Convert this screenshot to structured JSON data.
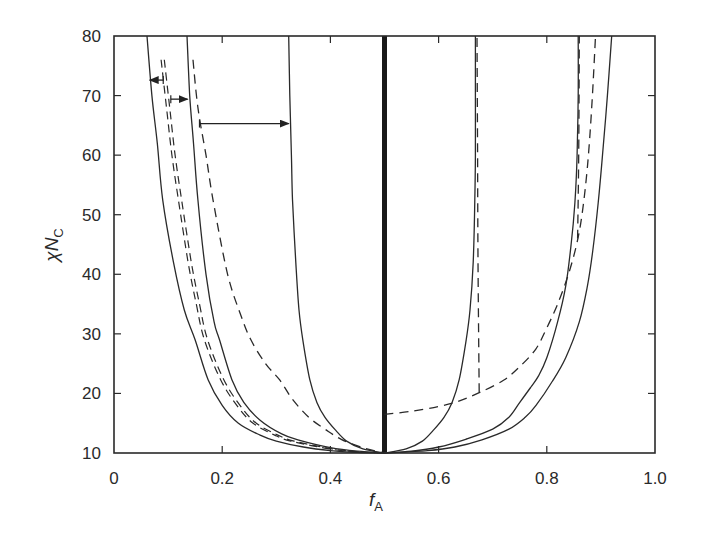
{
  "chart_data": {
    "type": "line",
    "title": "",
    "xlabel": "f",
    "xlabel_subscript": "A",
    "ylabel": "χN",
    "ylabel_subscript": "C",
    "xlim": [
      0,
      1.0
    ],
    "ylim": [
      10,
      80
    ],
    "grid": false,
    "legend": "none",
    "xticks": [
      0,
      0.2,
      0.4,
      0.6,
      0.8,
      1.0
    ],
    "xtick_labels": [
      "0",
      "0.2",
      "0.4",
      "0.6",
      "0.8",
      "1.0"
    ],
    "yticks": [
      10,
      20,
      30,
      40,
      50,
      60,
      70,
      80
    ],
    "ytick_labels": [
      "10",
      "20",
      "30",
      "40",
      "50",
      "60",
      "70",
      "80"
    ],
    "series": [
      {
        "name": "left-outer-solid",
        "style": "solid",
        "points": [
          [
            0.061,
            80
          ],
          [
            0.07,
            70
          ],
          [
            0.08,
            62
          ],
          [
            0.09,
            52.5
          ],
          [
            0.11,
            42
          ],
          [
            0.13,
            34
          ],
          [
            0.15,
            29
          ],
          [
            0.174,
            22.3
          ],
          [
            0.2,
            18
          ],
          [
            0.23,
            15
          ],
          [
            0.27,
            13
          ],
          [
            0.3,
            12
          ],
          [
            0.35,
            11
          ],
          [
            0.4,
            10.4
          ],
          [
            0.45,
            10.1
          ],
          [
            0.5,
            10
          ]
        ]
      },
      {
        "name": "left-double-dashed",
        "style": "double-dashed",
        "points": [
          [
            0.09,
            76
          ],
          [
            0.1,
            68
          ],
          [
            0.11,
            60
          ],
          [
            0.122,
            52.5
          ],
          [
            0.14,
            42
          ],
          [
            0.155,
            35
          ],
          [
            0.17,
            29
          ],
          [
            0.2,
            22.3
          ],
          [
            0.23,
            18
          ],
          [
            0.26,
            15
          ],
          [
            0.3,
            13
          ],
          [
            0.33,
            12
          ],
          [
            0.4,
            10.7
          ],
          [
            0.45,
            10.2
          ],
          [
            0.5,
            10
          ]
        ]
      },
      {
        "name": "left-second-solid",
        "style": "solid",
        "points": [
          [
            0.135,
            80
          ],
          [
            0.14,
            70
          ],
          [
            0.147,
            62
          ],
          [
            0.155,
            52.5
          ],
          [
            0.17,
            40
          ],
          [
            0.185,
            32
          ],
          [
            0.195,
            29
          ],
          [
            0.218,
            22.3
          ],
          [
            0.24,
            18.5
          ],
          [
            0.27,
            15.5
          ],
          [
            0.31,
            13.2
          ],
          [
            0.34,
            12.2
          ],
          [
            0.4,
            10.9
          ],
          [
            0.45,
            10.3
          ],
          [
            0.5,
            10
          ]
        ]
      },
      {
        "name": "left-dashed",
        "style": "dashed",
        "points": [
          [
            0.146,
            76
          ],
          [
            0.155,
            68
          ],
          [
            0.17,
            60
          ],
          [
            0.183,
            52.5
          ],
          [
            0.21,
            40
          ],
          [
            0.235,
            33
          ],
          [
            0.253,
            29
          ],
          [
            0.28,
            25
          ],
          [
            0.306,
            22.3
          ],
          [
            0.33,
            19
          ],
          [
            0.36,
            16
          ],
          [
            0.39,
            14
          ],
          [
            0.42,
            12.3
          ],
          [
            0.46,
            10.9
          ],
          [
            0.5,
            10
          ]
        ]
      },
      {
        "name": "left-inner-solid",
        "style": "solid",
        "points": [
          [
            0.323,
            80
          ],
          [
            0.325,
            70
          ],
          [
            0.328,
            60
          ],
          [
            0.33,
            52.5
          ],
          [
            0.336,
            42
          ],
          [
            0.342,
            34
          ],
          [
            0.349,
            29
          ],
          [
            0.362,
            22.3
          ],
          [
            0.375,
            18.5
          ],
          [
            0.39,
            16
          ],
          [
            0.41,
            13.8
          ],
          [
            0.43,
            12
          ],
          [
            0.46,
            10.7
          ],
          [
            0.5,
            10
          ]
        ]
      },
      {
        "name": "center-thick",
        "style": "thick",
        "points": [
          [
            0.5,
            10
          ],
          [
            0.5,
            80
          ]
        ]
      },
      {
        "name": "right-inner-solid",
        "style": "solid",
        "points": [
          [
            0.5,
            10
          ],
          [
            0.54,
            10.7
          ],
          [
            0.57,
            12
          ],
          [
            0.59,
            13.8
          ],
          [
            0.61,
            16
          ],
          [
            0.625,
            18.5
          ],
          [
            0.638,
            22.3
          ],
          [
            0.651,
            29
          ],
          [
            0.658,
            34
          ],
          [
            0.664,
            42
          ],
          [
            0.667,
            52.5
          ],
          [
            0.668,
            60
          ],
          [
            0.668,
            70
          ],
          [
            0.668,
            80
          ]
        ]
      },
      {
        "name": "right-middle-solid",
        "style": "solid",
        "points": [
          [
            0.5,
            10
          ],
          [
            0.55,
            10.3
          ],
          [
            0.6,
            11
          ],
          [
            0.65,
            12.3
          ],
          [
            0.7,
            14
          ],
          [
            0.73,
            16
          ],
          [
            0.75,
            18.5
          ],
          [
            0.77,
            21
          ],
          [
            0.785,
            23
          ],
          [
            0.8,
            26
          ],
          [
            0.82,
            32
          ],
          [
            0.835,
            38
          ],
          [
            0.845,
            45
          ],
          [
            0.852,
            52
          ],
          [
            0.856,
            60
          ],
          [
            0.858,
            70
          ],
          [
            0.858,
            80
          ]
        ]
      },
      {
        "name": "right-outer-solid",
        "style": "solid",
        "points": [
          [
            0.5,
            10
          ],
          [
            0.58,
            10.4
          ],
          [
            0.63,
            11
          ],
          [
            0.68,
            12.2
          ],
          [
            0.73,
            14
          ],
          [
            0.76,
            16
          ],
          [
            0.78,
            18
          ],
          [
            0.81,
            22
          ],
          [
            0.835,
            26
          ],
          [
            0.86,
            32
          ],
          [
            0.875,
            38
          ],
          [
            0.885,
            44
          ],
          [
            0.895,
            52
          ],
          [
            0.903,
            60
          ],
          [
            0.912,
            70
          ],
          [
            0.92,
            80
          ]
        ]
      },
      {
        "name": "right-dashed-curve",
        "style": "dashed",
        "points": [
          [
            0.5,
            16.5
          ],
          [
            0.55,
            17
          ],
          [
            0.6,
            17.8
          ],
          [
            0.64,
            18.8
          ],
          [
            0.677,
            20.2
          ],
          [
            0.72,
            22.2
          ],
          [
            0.75,
            24.5
          ],
          [
            0.78,
            27.5
          ],
          [
            0.8,
            31
          ],
          [
            0.82,
            35
          ],
          [
            0.84,
            40
          ],
          [
            0.855,
            45
          ],
          [
            0.865,
            50
          ],
          [
            0.875,
            58
          ],
          [
            0.883,
            68
          ],
          [
            0.89,
            80
          ]
        ]
      },
      {
        "name": "right-dashed-vertical-067",
        "style": "dashed",
        "points": [
          [
            0.675,
            20.2
          ],
          [
            0.673,
            40
          ],
          [
            0.672,
            60
          ],
          [
            0.671,
            80
          ]
        ]
      },
      {
        "name": "right-dashed-vertical-086",
        "style": "dashed",
        "points": [
          [
            0.857,
            46
          ],
          [
            0.859,
            60
          ],
          [
            0.86,
            80
          ]
        ]
      }
    ],
    "annotations": [
      {
        "type": "arrow",
        "direction": "left",
        "y": 72.6,
        "from_x": 0.091,
        "to_x": 0.066
      },
      {
        "type": "arrow",
        "direction": "right",
        "y": 69.4,
        "from_x": 0.105,
        "to_x": 0.136
      },
      {
        "type": "arrow",
        "direction": "right",
        "y": 65.3,
        "from_x": 0.158,
        "to_x": 0.323
      }
    ]
  }
}
